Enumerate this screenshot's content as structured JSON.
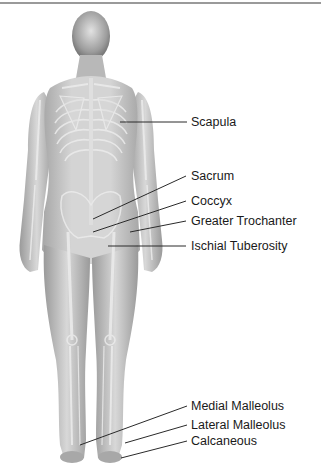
{
  "diagram": {
    "title": "",
    "labels": [
      {
        "id": "scapula",
        "text": "Scapula",
        "label_y": 118,
        "line": [
          120,
          122,
          187,
          122
        ]
      },
      {
        "id": "sacrum",
        "text": "Sacrum",
        "label_y": 174,
        "line": [
          93,
          219,
          186,
          176
        ]
      },
      {
        "id": "coccyx",
        "text": "Coccyx",
        "label_y": 196,
        "line": [
          93,
          232,
          186,
          201
        ]
      },
      {
        "id": "greater-trochanter",
        "text": "Greater Trochanter",
        "label_y": 216,
        "line": [
          130,
          232,
          186,
          221
        ]
      },
      {
        "id": "ischial-tuberosity",
        "text": "Ischial Tuberosity",
        "label_y": 236,
        "line": [
          108,
          246,
          186,
          246
        ]
      },
      {
        "id": "medial-malleolus",
        "text": "Medial Malleolus",
        "label_y": 398,
        "line": [
          80,
          445,
          187,
          406
        ]
      },
      {
        "id": "lateral-malleolus",
        "text": "Lateral Malleolus",
        "label_y": 418,
        "line": [
          125,
          443,
          187,
          425
        ]
      },
      {
        "id": "calcaneous",
        "text": "Calcaneous",
        "label_y": 436,
        "line": [
          121,
          458,
          187,
          441
        ]
      }
    ],
    "colors": {
      "body": "#c8c8c8",
      "body_shade": "#a9a9a9",
      "bone": "#e6e6e6",
      "leader_line": "#2a2a2a",
      "label_text": "#1a1a1a",
      "top_rule": "#9a9a9a"
    }
  }
}
